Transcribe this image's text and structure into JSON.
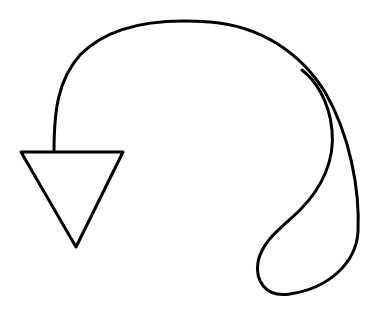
{
  "drawing": {
    "subject": "hand-drawn curved arrow pointing down",
    "stroke_color": "#000000",
    "background_color": "#ffffff"
  }
}
